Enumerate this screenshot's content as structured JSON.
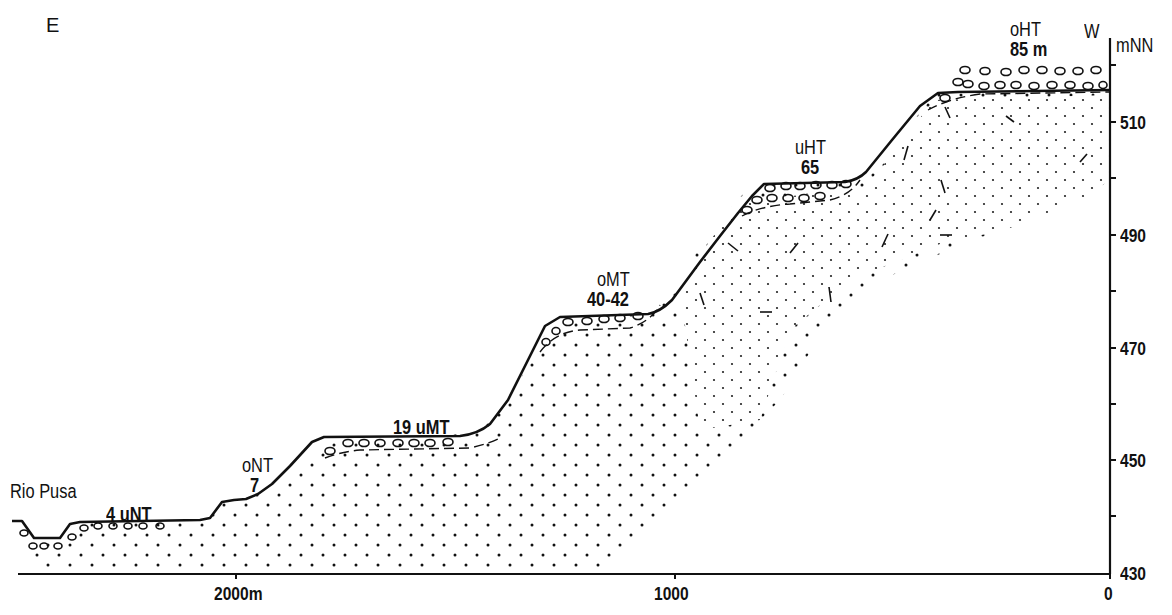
{
  "diagram": {
    "type": "geological-cross-section",
    "orientation": {
      "left": "E",
      "right": "W"
    },
    "river": "Rio Pusa",
    "y_axis": {
      "unit": "mNN",
      "ticks": [
        "510",
        "490",
        "470",
        "450",
        "430"
      ],
      "range": [
        430,
        520
      ]
    },
    "x_axis": {
      "ticks": [
        "2000m",
        "1000",
        "0"
      ]
    },
    "terraces": [
      {
        "name": "uNT",
        "height": "4",
        "label": "4  uNT"
      },
      {
        "name": "oNT",
        "height": "7"
      },
      {
        "name": "uMT",
        "height": "19",
        "label": "19 uMT"
      },
      {
        "name": "oMT",
        "height": "40-42"
      },
      {
        "name": "uHT",
        "height": "65"
      },
      {
        "name": "oHT",
        "height": "85 m"
      }
    ],
    "colors": {
      "ink": "#111111",
      "paper": "#ffffff"
    }
  }
}
